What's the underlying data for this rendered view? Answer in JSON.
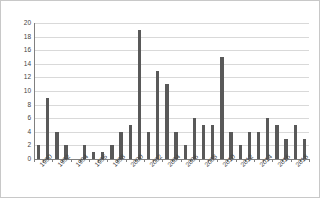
{
  "chart_data": {
    "type": "bar",
    "title": "",
    "xlabel": "",
    "ylabel": "Numbers of birds",
    "ylim": [
      0,
      20
    ],
    "y_ticks": [
      0,
      2,
      4,
      6,
      8,
      10,
      12,
      14,
      16,
      18,
      20
    ],
    "grid": true,
    "legend": "none",
    "bar_color": "#595959",
    "gridline_color": "#d9d9d9",
    "axis_color": "#808080",
    "border_color": "#c8c8c8",
    "text_color": "#3f3f3f",
    "x_tick_label_rotation": -45,
    "x_tick_labels_shown": [
      "1990",
      "1992",
      "1994",
      "1996",
      "1998",
      "2000",
      "2002",
      "2004",
      "2006",
      "2008",
      "2010",
      "2012",
      "2014",
      "2016",
      "2018"
    ],
    "categories": [
      "1990",
      "1991",
      "1992",
      "1993",
      "1994",
      "1995",
      "1996",
      "1997",
      "1998",
      "1999",
      "2000",
      "2001",
      "2002",
      "2003",
      "2004",
      "2005",
      "2006",
      "2007",
      "2008",
      "2009",
      "2010",
      "2011",
      "2012",
      "2013",
      "2014",
      "2015",
      "2016",
      "2017",
      "2018",
      "2019"
    ],
    "values": [
      2,
      9,
      4,
      2,
      0,
      2,
      1,
      1,
      2,
      4,
      5,
      19,
      4,
      13,
      11,
      4,
      2,
      6,
      5,
      5,
      15,
      4,
      2,
      4,
      4,
      6,
      5,
      3,
      5,
      3
    ]
  }
}
